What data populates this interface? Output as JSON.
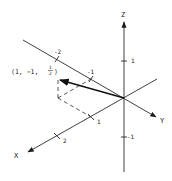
{
  "diagram": {
    "type": "3d-coordinate-axes-with-vector",
    "colors": {
      "ink": "#2a2a2a",
      "background": "#ffffff"
    },
    "axes": {
      "x": {
        "label": "X",
        "ticks": [
          {
            "value": "1"
          },
          {
            "value": "2"
          }
        ]
      },
      "y": {
        "label": "Y",
        "ticks": [
          {
            "value": "-1"
          },
          {
            "value": "-2"
          }
        ]
      },
      "z": {
        "label": "Z",
        "ticks": [
          {
            "value": "1"
          },
          {
            "value": "-1"
          }
        ]
      }
    },
    "vector": {
      "label_open": "⟨1, −1, ",
      "label_num": "1",
      "label_den": "2",
      "label_close": "⟩",
      "components": [
        1,
        -1,
        0.5
      ]
    }
  }
}
